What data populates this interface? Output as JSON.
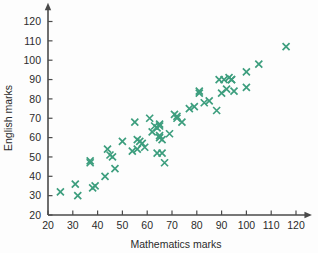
{
  "chart_data": {
    "type": "scatter",
    "title": "",
    "xlabel": "Mathematics marks",
    "ylabel": "English marks",
    "xlim": [
      20,
      122
    ],
    "ylim": [
      20,
      125
    ],
    "grid": false,
    "legend": null,
    "marker": {
      "shape": "x-cross",
      "color": "#3d9e7e",
      "size": 7
    },
    "axis_color": "#4a4a4a",
    "xticks": [
      20,
      30,
      40,
      50,
      60,
      70,
      80,
      90,
      100,
      110,
      120
    ],
    "yticks": [
      20,
      30,
      40,
      50,
      60,
      70,
      80,
      90,
      100,
      110,
      120
    ],
    "xtick_labels": [
      "20",
      "30",
      "40",
      "50",
      "60",
      "70",
      "80",
      "90",
      "100",
      "110",
      "120"
    ],
    "ytick_labels": [
      "20",
      "30",
      "40",
      "50",
      "60",
      "70",
      "80",
      "90",
      "100",
      "110",
      "120"
    ],
    "points": [
      [
        25,
        32
      ],
      [
        31,
        36
      ],
      [
        32,
        30
      ],
      [
        37,
        48
      ],
      [
        37,
        47
      ],
      [
        38,
        34
      ],
      [
        39,
        35
      ],
      [
        43,
        40
      ],
      [
        44,
        54
      ],
      [
        45,
        51
      ],
      [
        46,
        50
      ],
      [
        47,
        44
      ],
      [
        50,
        58
      ],
      [
        54,
        53
      ],
      [
        55,
        68
      ],
      [
        56,
        59
      ],
      [
        56,
        54
      ],
      [
        57,
        58
      ],
      [
        58,
        57
      ],
      [
        59,
        55
      ],
      [
        61,
        70
      ],
      [
        62,
        63
      ],
      [
        63,
        66
      ],
      [
        64,
        65
      ],
      [
        64,
        52
      ],
      [
        65,
        67
      ],
      [
        65,
        66
      ],
      [
        65,
        61
      ],
      [
        65,
        60
      ],
      [
        66,
        59
      ],
      [
        66,
        52
      ],
      [
        67,
        47
      ],
      [
        69,
        62
      ],
      [
        71,
        72
      ],
      [
        72,
        71
      ],
      [
        72,
        70
      ],
      [
        74,
        68
      ],
      [
        77,
        75
      ],
      [
        79,
        76
      ],
      [
        81,
        84
      ],
      [
        81,
        83
      ],
      [
        83,
        78
      ],
      [
        85,
        79
      ],
      [
        88,
        74
      ],
      [
        89,
        90
      ],
      [
        90,
        83
      ],
      [
        91,
        90
      ],
      [
        92,
        85
      ],
      [
        93,
        91
      ],
      [
        94,
        90
      ],
      [
        94,
        90
      ],
      [
        95,
        84
      ],
      [
        100,
        94
      ],
      [
        100,
        86
      ],
      [
        105,
        98
      ],
      [
        116,
        107
      ]
    ]
  },
  "axis_titles": {
    "x": "Mathematics marks",
    "y": "English marks"
  }
}
